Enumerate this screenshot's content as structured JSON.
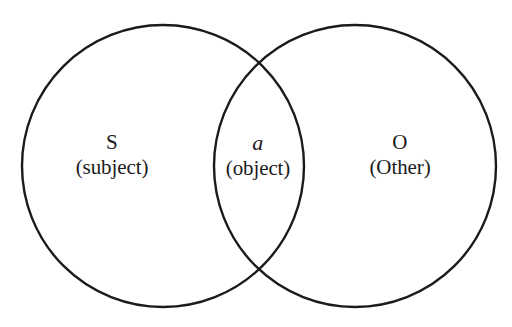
{
  "diagram": {
    "background_color": "#ffffff",
    "stroke_color": "#1b1b1b",
    "stroke_width": 2.4,
    "circles": [
      {
        "name": "left-circle",
        "label": "S",
        "cx": 163,
        "cy": 166,
        "r": 141
      },
      {
        "name": "right-circle",
        "label": "O",
        "cx": 355,
        "cy": 166,
        "r": 141
      }
    ],
    "intersection": {
      "name": "lens",
      "top_point": {
        "x": 259,
        "y": 60
      },
      "bottom_point": {
        "x": 259,
        "y": 272
      }
    },
    "regions": [
      {
        "id": "subject",
        "symbol": "S",
        "gloss": "(subject)",
        "symbol_italic": false,
        "center": {
          "x": 112,
          "y": 160
        }
      },
      {
        "id": "object",
        "symbol": "a",
        "gloss": "(object)",
        "symbol_italic": true,
        "center": {
          "x": 258,
          "y": 160
        }
      },
      {
        "id": "other",
        "symbol": "O",
        "gloss": "(Other)",
        "symbol_italic": false,
        "center": {
          "x": 400,
          "y": 160
        }
      }
    ]
  }
}
